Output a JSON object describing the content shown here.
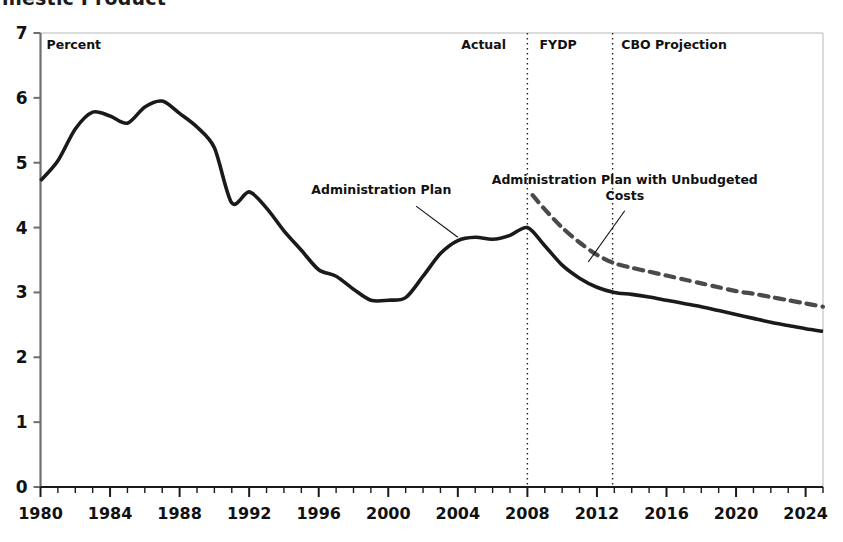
{
  "figure": {
    "title_partial": "mestic Product",
    "background": "#ffffff"
  },
  "axes": {
    "y_unit_label": "Percent",
    "y_ticks": [
      "0",
      "1",
      "2",
      "3",
      "4",
      "5",
      "6",
      "7"
    ],
    "x_ticks": [
      "1980",
      "1984",
      "1988",
      "1992",
      "1996",
      "2000",
      "2004",
      "2008",
      "2012",
      "2016",
      "2020",
      "2024"
    ],
    "axis_color": "#6e6e6e",
    "tick_color": "#1a1a1a"
  },
  "regions": [
    {
      "label": "Actual",
      "x_label_year": 2004.2
    },
    {
      "label": "FYDP",
      "x_label_year": 2008.7
    },
    {
      "label": "CBO Projection",
      "x_label_year": 2013.4
    }
  ],
  "dividers": [
    {
      "year": 2008.0
    },
    {
      "year": 2012.9
    }
  ],
  "annotations": [
    {
      "name": "administration-plan",
      "text": "Administration Plan",
      "text_x_year": 1999.6,
      "text_y_value": 4.52,
      "leader": {
        "x1_year": 2001.6,
        "y1_value": 4.33,
        "x2_year": 2004.0,
        "y2_value": 3.85
      }
    },
    {
      "name": "administration-plan-unbudgeted-line1",
      "text": "Administration Plan with Unbudgeted",
      "text_x_year": 2013.6,
      "text_y_value": 4.67
    },
    {
      "name": "administration-plan-unbudgeted-line2",
      "text": "Costs",
      "text_x_year": 2013.6,
      "text_y_value": 4.42,
      "leader": {
        "x1_year": 2013.6,
        "y1_value": 4.26,
        "x2_year": 2011.5,
        "y2_value": 3.47
      }
    }
  ],
  "chart_data": {
    "type": "line",
    "title": "mestic Product",
    "xlabel": "",
    "ylabel": "Percent",
    "xlim": [
      1980,
      2025
    ],
    "ylim": [
      0,
      7
    ],
    "grid": false,
    "legend": "none (in-plot annotations)",
    "series": [
      {
        "name": "Administration Plan",
        "style": "solid",
        "color": "#1a1a1a",
        "width": 3.6,
        "x": [
          1980,
          1981,
          1982,
          1983,
          1984,
          1985,
          1986,
          1987,
          1988,
          1989,
          1990,
          1991,
          1992,
          1993,
          1994,
          1995,
          1996,
          1997,
          1998,
          1999,
          2000,
          2001,
          2002,
          2003,
          2004,
          2005,
          2006,
          2007,
          2008,
          2009,
          2010,
          2011,
          2012,
          2013,
          2014,
          2015,
          2016,
          2017,
          2018,
          2019,
          2020,
          2021,
          2022,
          2023,
          2024,
          2025
        ],
        "y": [
          4.72,
          5.03,
          5.52,
          5.78,
          5.72,
          5.61,
          5.86,
          5.95,
          5.76,
          5.55,
          5.23,
          4.38,
          4.55,
          4.3,
          3.95,
          3.65,
          3.35,
          3.25,
          3.05,
          2.88,
          2.88,
          2.92,
          3.25,
          3.6,
          3.8,
          3.85,
          3.82,
          3.88,
          4.0,
          3.72,
          3.42,
          3.22,
          3.08,
          3.0,
          2.97,
          2.93,
          2.88,
          2.83,
          2.78,
          2.72,
          2.66,
          2.6,
          2.54,
          2.49,
          2.44,
          2.4
        ]
      },
      {
        "name": "Administration Plan with Unbudgeted Costs",
        "style": "dashed",
        "color": "#4a4a4a",
        "width": 4.2,
        "x": [
          2008.3,
          2009,
          2010,
          2011,
          2012,
          2013,
          2014,
          2015,
          2016,
          2017,
          2018,
          2019,
          2020,
          2021,
          2022,
          2023,
          2024,
          2025
        ],
        "y": [
          4.5,
          4.28,
          4.0,
          3.77,
          3.58,
          3.45,
          3.38,
          3.32,
          3.26,
          3.2,
          3.14,
          3.08,
          3.02,
          2.98,
          2.93,
          2.88,
          2.83,
          2.78
        ]
      }
    ]
  }
}
